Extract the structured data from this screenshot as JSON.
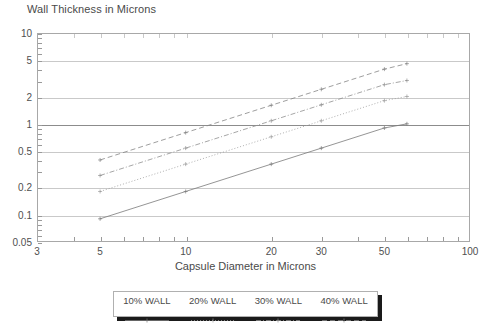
{
  "chart_data": {
    "type": "line",
    "title": "Wall Thickness in Microns",
    "xlabel": "Capsule Diameter in Microns",
    "ylabel": "",
    "xscale": "log",
    "yscale": "log",
    "xlim": [
      3,
      100
    ],
    "ylim": [
      0.05,
      10
    ],
    "grid": true,
    "legend_position": "bottom-outside",
    "xticks": [
      3,
      5,
      10,
      20,
      30,
      50,
      100
    ],
    "xtick_labels": [
      "3",
      "5",
      "10",
      "20",
      "30",
      "50",
      "100"
    ],
    "yticks": [
      0.05,
      0.1,
      0.2,
      0.5,
      1,
      2,
      5,
      10
    ],
    "ytick_labels": [
      "0.05",
      "0.1",
      "0.2",
      "0.5",
      "1",
      "2",
      "5",
      "10"
    ],
    "series": [
      {
        "name": "10% WALL",
        "style": "solid",
        "color": "#7a7a7a",
        "x": [
          5,
          10,
          20,
          30,
          50,
          60
        ],
        "y": [
          0.09,
          0.18,
          0.36,
          0.54,
          0.9,
          1.0
        ]
      },
      {
        "name": "20% WALL",
        "style": "dotted",
        "color": "#9b9b9b",
        "x": [
          5,
          10,
          20,
          30,
          50,
          60
        ],
        "y": [
          0.18,
          0.36,
          0.72,
          1.08,
          1.8,
          2.0
        ]
      },
      {
        "name": "30% WALL",
        "style": "dash-dot",
        "color": "#8f8f8f",
        "x": [
          5,
          10,
          20,
          30,
          50,
          60
        ],
        "y": [
          0.27,
          0.54,
          1.08,
          1.62,
          2.7,
          3.0
        ]
      },
      {
        "name": "40% WALL",
        "style": "dashed",
        "color": "#858585",
        "x": [
          5,
          10,
          20,
          30,
          50,
          60
        ],
        "y": [
          0.4,
          0.8,
          1.6,
          2.4,
          4.0,
          4.6
        ]
      }
    ]
  },
  "legend": {
    "items": [
      {
        "label": "10% WALL"
      },
      {
        "label": "20% WALL"
      },
      {
        "label": "30% WALL"
      },
      {
        "label": "40% WALL"
      }
    ]
  },
  "colors": {
    "frame": "#a8a8a8",
    "grid": "#c9c9c9",
    "grid_major": "#8c8c8c",
    "text": "#4a4a4a",
    "legend_shadow": "#1a1a1a"
  }
}
